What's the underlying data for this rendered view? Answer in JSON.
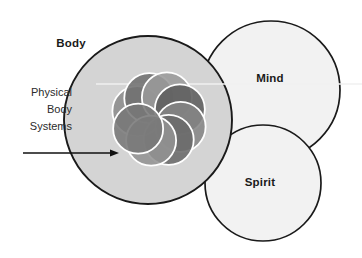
{
  "diagram": {
    "background_color": "#ffffff",
    "outline_color": "#1a1a1a",
    "main_circles": [
      {
        "key": "body",
        "label": "Body",
        "fill": "#d4d4d4",
        "cx": 148,
        "cy": 120,
        "r": 84,
        "label_x": 71,
        "label_y": 47
      },
      {
        "key": "mind",
        "label": "Mind",
        "fill": "#f2f2f2",
        "cx": 271,
        "cy": 90,
        "r": 69,
        "label_x": 270,
        "label_y": 82
      },
      {
        "key": "spirit",
        "label": "Spirit",
        "fill": "#f2f2f2",
        "cx": 263,
        "cy": 183,
        "r": 58,
        "label_x": 260,
        "label_y": 186
      }
    ],
    "callout": {
      "lines": [
        "Physical",
        "Body",
        "Systems"
      ],
      "text_anchor_x": 72,
      "line_y_start": 96,
      "line_height": 17,
      "arrow": {
        "x1": 23,
        "y1": 153,
        "x2": 119,
        "y2": 153,
        "color": "#111111",
        "stroke_width": 1.6,
        "head_length": 9,
        "head_width": 7
      }
    },
    "cluster": {
      "name": "physical-body-systems-cluster",
      "cx": 159,
      "cy": 119,
      "orbit_radius": 23,
      "petal_radius": 25,
      "ring_color": "#ffffff",
      "ring_width": 1.8,
      "count": 8,
      "fills": [
        "#8c8c8c",
        "#6f6f6f",
        "#9a9a9a",
        "#5d5d5d",
        "#858585",
        "#6a6a6a",
        "#939393",
        "#787878"
      ],
      "start_angle_deg": 200,
      "opacity": 0.88
    },
    "scan_line": {
      "y": 84,
      "x1": 96,
      "x2": 362,
      "color": "#f0f0f0",
      "width": 1.4
    }
  }
}
